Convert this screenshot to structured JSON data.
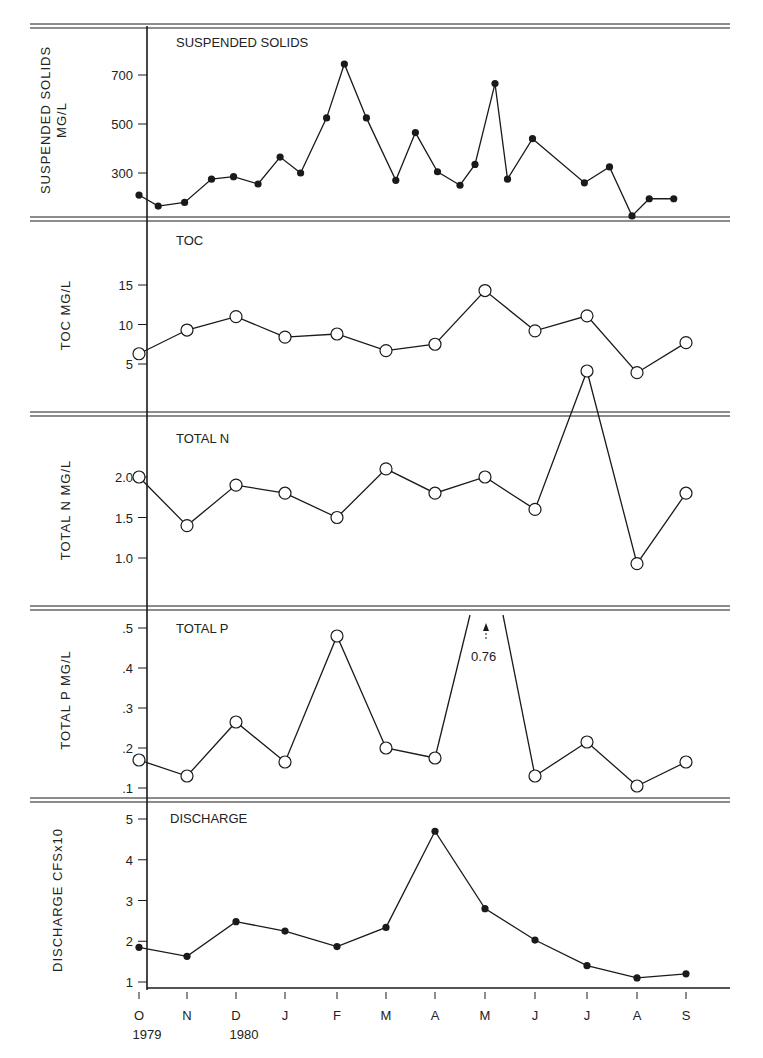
{
  "figure": {
    "x_tick_labels": [
      "O",
      "N",
      "D",
      "J",
      "F",
      "M",
      "A",
      "M",
      "J",
      "J",
      "A",
      "S"
    ],
    "year_labels": [
      {
        "label": "1979",
        "month_index": 0
      },
      {
        "label": "1980",
        "month_index": 2
      }
    ],
    "ink_color": "#1a1a1a",
    "background": "#ffffff"
  },
  "chart_data": [
    {
      "type": "line",
      "title": "SUSPENDED SOLIDS",
      "ylabel": "SUSPENDED SOLIDS MG/L",
      "yticks": [
        300,
        500,
        700
      ],
      "marker": "filled",
      "x_axis": "months Oct 1979 - Sep 1980 (sampled approximately biweekly)",
      "series": [
        {
          "name": "Suspended Solids (mg/L)",
          "x": [
            0.0,
            0.4,
            0.95,
            1.5,
            1.95,
            2.45,
            2.9,
            3.3,
            3.8,
            4.15,
            4.6,
            5.2,
            5.6,
            6.05,
            6.5,
            6.8,
            7.2,
            7.45,
            7.95,
            8.95,
            9.45,
            9.9,
            10.25,
            10.75
          ],
          "values": [
            210,
            165,
            180,
            275,
            285,
            255,
            365,
            300,
            525,
            745,
            525,
            270,
            465,
            305,
            250,
            335,
            665,
            275,
            440,
            260,
            325,
            125,
            195,
            195
          ]
        }
      ]
    },
    {
      "type": "line",
      "title": "TOC",
      "ylabel": "TOC MG/L",
      "yticks": [
        5,
        10,
        15
      ],
      "marker": "open",
      "categories": [
        "Oct",
        "Nov",
        "Dec",
        "Jan",
        "Feb",
        "Mar",
        "Apr",
        "May",
        "Jun",
        "Jul",
        "Aug",
        "Sep"
      ],
      "series": [
        {
          "name": "TOC (mg/L)",
          "values": [
            6.3,
            9.3,
            11.0,
            8.4,
            8.8,
            6.7,
            7.5,
            14.3,
            9.2,
            11.1,
            3.9,
            7.7
          ]
        }
      ]
    },
    {
      "type": "line",
      "title": "TOTAL N",
      "ylabel": "TOTAL N MG/L",
      "yticks": [
        1.0,
        1.5,
        2.0
      ],
      "marker": "open",
      "categories": [
        "Oct",
        "Nov",
        "Dec",
        "Jan",
        "Feb",
        "Mar",
        "Apr",
        "May",
        "Jun",
        "Jul",
        "Aug",
        "Sep"
      ],
      "series": [
        {
          "name": "Total N (mg/L)",
          "values": [
            2.0,
            1.4,
            1.9,
            1.8,
            1.5,
            2.1,
            1.8,
            2.0,
            1.6,
            4.2,
            0.93,
            1.8
          ]
        }
      ],
      "note": "July value exceeds panel and plots into TOC panel"
    },
    {
      "type": "line",
      "title": "TOTAL P",
      "ylabel": "TOTAL P MG/L",
      "yticks": [
        0.1,
        0.2,
        0.3,
        0.4,
        0.5
      ],
      "ytick_labels": [
        ".1",
        ".2",
        ".3",
        ".4",
        ".5"
      ],
      "marker": "open",
      "categories": [
        "Oct",
        "Nov",
        "Dec",
        "Jan",
        "Feb",
        "Mar",
        "Apr",
        "May",
        "Jun",
        "Jul",
        "Aug",
        "Sep"
      ],
      "series": [
        {
          "name": "Total P (mg/L)",
          "values": [
            0.17,
            0.13,
            0.265,
            0.165,
            0.48,
            0.2,
            0.175,
            0.76,
            0.13,
            0.215,
            0.105,
            0.165
          ]
        }
      ],
      "annotations": [
        {
          "text": "0.76",
          "month_index": 7
        }
      ]
    },
    {
      "type": "line",
      "title": "DISCHARGE",
      "ylabel": "DISCHARGE CFSx10",
      "yticks": [
        1,
        2,
        3,
        4,
        5
      ],
      "marker": "filled",
      "categories": [
        "Oct",
        "Nov",
        "Dec",
        "Jan",
        "Feb",
        "Mar",
        "Apr",
        "May",
        "Jun",
        "Jul",
        "Aug",
        "Sep"
      ],
      "series": [
        {
          "name": "Discharge (cfs x10)",
          "values": [
            1.85,
            1.63,
            2.48,
            2.25,
            1.87,
            2.34,
            4.7,
            2.8,
            2.03,
            1.4,
            1.1,
            1.2
          ]
        }
      ]
    }
  ]
}
